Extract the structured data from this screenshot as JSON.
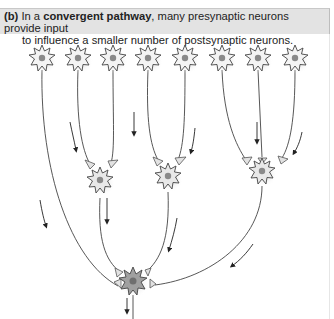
{
  "figure": {
    "label": "(b)",
    "caption_pre": " In a ",
    "caption_bold": "convergent pathway",
    "caption_post": ", many presynaptic neurons provide input",
    "caption_line2": "to influence a smaller number of postsynaptic neurons."
  },
  "diagram": {
    "type": "convergent neural pathway",
    "colors": {
      "axon": "#444444",
      "cell_body": "#f2f2f2",
      "nucleus": "#8a8a8a",
      "postsynaptic_cell": "#9a9a9a",
      "synapse_terminal": "#e0e0e0",
      "arrow": "#222222"
    },
    "layers": [
      {
        "name": "presynaptic",
        "count": 8
      },
      {
        "name": "intermediate",
        "count": 3
      },
      {
        "name": "postsynaptic",
        "count": 1
      }
    ]
  }
}
